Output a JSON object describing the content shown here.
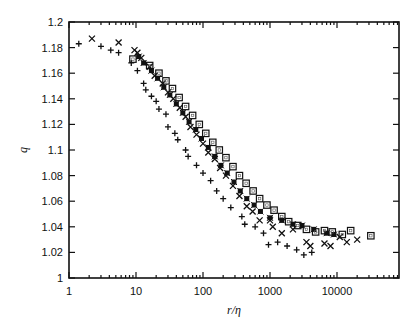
{
  "chart_data": {
    "type": "scatter",
    "title": "",
    "xlabel": "r/η",
    "ylabel": "q",
    "xscale": "log",
    "xlim": [
      1,
      80000
    ],
    "ylim": [
      1.0,
      1.2
    ],
    "grid": false,
    "legend": null,
    "x_ticks": [
      1,
      10,
      100,
      1000,
      10000
    ],
    "x_tick_labels": [
      "1",
      "10",
      "100",
      "1000",
      "10000"
    ],
    "y_ticks": [
      1.0,
      1.02,
      1.04,
      1.06,
      1.08,
      1.1,
      1.12,
      1.14,
      1.16,
      1.18,
      1.2
    ],
    "y_tick_labels": [
      "1",
      "1.02",
      "1.04",
      "1.06",
      "1.08",
      "1.1",
      "1.12",
      "1.14",
      "1.16",
      "1.18",
      "1.2"
    ],
    "series": [
      {
        "name": "plus",
        "marker": "+",
        "points": [
          [
            1.4,
            1.183
          ],
          [
            3.0,
            1.181
          ],
          [
            4.2,
            1.178
          ],
          [
            5.5,
            1.176
          ],
          [
            8.5,
            1.168
          ],
          [
            10.5,
            1.162
          ],
          [
            13,
            1.152
          ],
          [
            14,
            1.147
          ],
          [
            17,
            1.142
          ],
          [
            20,
            1.138
          ],
          [
            22,
            1.132
          ],
          [
            28,
            1.128
          ],
          [
            30,
            1.118
          ],
          [
            38,
            1.113
          ],
          [
            42,
            1.108
          ],
          [
            55,
            1.1
          ],
          [
            60,
            1.095
          ],
          [
            80,
            1.088
          ],
          [
            100,
            1.082
          ],
          [
            130,
            1.076
          ],
          [
            160,
            1.068
          ],
          [
            200,
            1.062
          ],
          [
            260,
            1.055
          ],
          [
            380,
            1.048
          ],
          [
            420,
            1.042
          ],
          [
            600,
            1.04
          ],
          [
            800,
            1.035
          ],
          [
            950,
            1.026
          ],
          [
            1300,
            1.028
          ],
          [
            1800,
            1.025
          ],
          [
            2500,
            1.022
          ],
          [
            3200,
            1.018
          ],
          [
            4200,
            1.02
          ]
        ]
      },
      {
        "name": "cross",
        "marker": "x",
        "points": [
          [
            2.2,
            1.187
          ],
          [
            5.5,
            1.184
          ],
          [
            9.5,
            1.178
          ],
          [
            10.5,
            1.176
          ],
          [
            12,
            1.172
          ],
          [
            16,
            1.165
          ],
          [
            19,
            1.158
          ],
          [
            25,
            1.152
          ],
          [
            30,
            1.145
          ],
          [
            36,
            1.14
          ],
          [
            45,
            1.133
          ],
          [
            55,
            1.126
          ],
          [
            65,
            1.118
          ],
          [
            80,
            1.112
          ],
          [
            100,
            1.105
          ],
          [
            120,
            1.098
          ],
          [
            150,
            1.093
          ],
          [
            180,
            1.086
          ],
          [
            220,
            1.08
          ],
          [
            280,
            1.072
          ],
          [
            350,
            1.064
          ],
          [
            450,
            1.056
          ],
          [
            550,
            1.052
          ],
          [
            700,
            1.045
          ],
          [
            1000,
            1.045
          ],
          [
            1100,
            1.04
          ],
          [
            1500,
            1.035
          ],
          [
            2200,
            1.038
          ],
          [
            3500,
            1.028
          ],
          [
            4000,
            1.025
          ],
          [
            6500,
            1.027
          ],
          [
            8000,
            1.025
          ],
          [
            11000,
            1.032
          ],
          [
            14000,
            1.028
          ],
          [
            20000,
            1.03
          ]
        ]
      },
      {
        "name": "filled-square",
        "marker": "filled-square",
        "points": [
          [
            11,
            1.173
          ],
          [
            13,
            1.168
          ],
          [
            17,
            1.162
          ],
          [
            21,
            1.156
          ],
          [
            26,
            1.149
          ],
          [
            32,
            1.143
          ],
          [
            40,
            1.136
          ],
          [
            50,
            1.129
          ],
          [
            62,
            1.122
          ],
          [
            78,
            1.116
          ],
          [
            95,
            1.109
          ],
          [
            120,
            1.102
          ],
          [
            150,
            1.095
          ],
          [
            185,
            1.088
          ],
          [
            230,
            1.082
          ],
          [
            290,
            1.075
          ],
          [
            360,
            1.068
          ],
          [
            450,
            1.062
          ],
          [
            580,
            1.057
          ],
          [
            720,
            1.052
          ],
          [
            1000,
            1.047
          ],
          [
            1500,
            1.045
          ],
          [
            2200,
            1.042
          ],
          [
            3000,
            1.041
          ],
          [
            4500,
            1.038
          ],
          [
            7000,
            1.035
          ],
          [
            9000,
            1.034
          ]
        ]
      },
      {
        "name": "open-square",
        "marker": "open-square",
        "points": [
          [
            9,
            1.171
          ],
          [
            16,
            1.166
          ],
          [
            22,
            1.16
          ],
          [
            28,
            1.154
          ],
          [
            35,
            1.148
          ],
          [
            44,
            1.141
          ],
          [
            55,
            1.134
          ],
          [
            70,
            1.127
          ],
          [
            88,
            1.12
          ],
          [
            110,
            1.113
          ],
          [
            140,
            1.106
          ],
          [
            175,
            1.1
          ],
          [
            220,
            1.094
          ],
          [
            280,
            1.087
          ],
          [
            350,
            1.08
          ],
          [
            440,
            1.074
          ],
          [
            560,
            1.068
          ],
          [
            700,
            1.062
          ],
          [
            900,
            1.057
          ],
          [
            1150,
            1.053
          ],
          [
            1500,
            1.048
          ],
          [
            1900,
            1.044
          ],
          [
            2600,
            1.041
          ],
          [
            3500,
            1.038
          ],
          [
            4800,
            1.036
          ],
          [
            6500,
            1.037
          ],
          [
            8500,
            1.036
          ],
          [
            12000,
            1.034
          ],
          [
            16000,
            1.037
          ],
          [
            32000,
            1.033
          ]
        ]
      }
    ]
  },
  "axes": {
    "xlabel": "r/η",
    "ylabel": "q"
  }
}
